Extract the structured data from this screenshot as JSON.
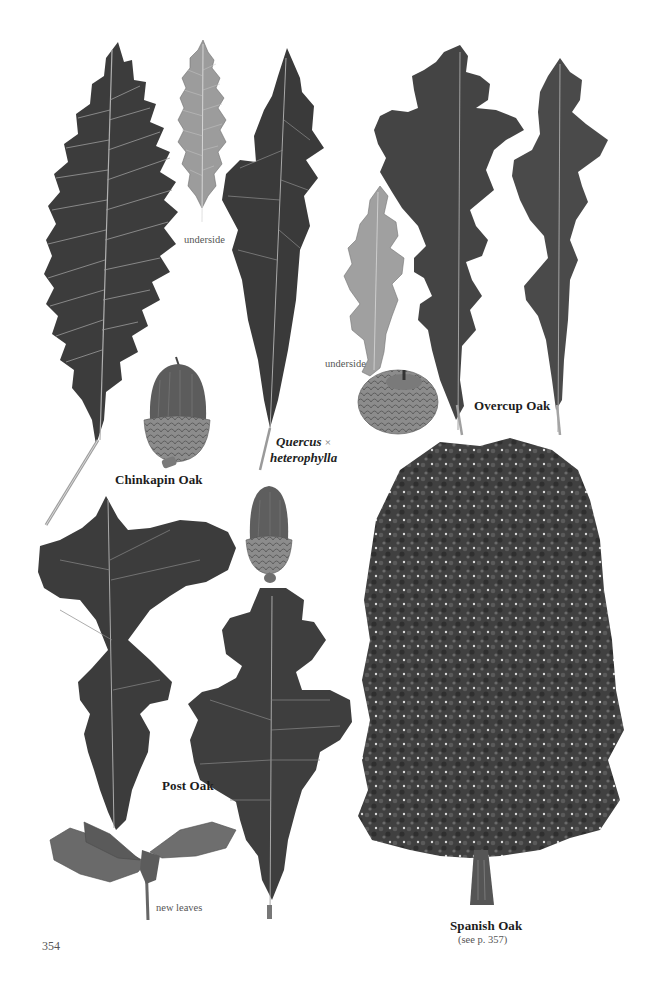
{
  "page": {
    "number": "354",
    "background": "#ffffff"
  },
  "species": [
    {
      "id": "chinkapin-oak",
      "label": "Chinkapin Oak",
      "items": [
        "leaf",
        "leaf-underside",
        "acorn"
      ],
      "underside_label": "underside"
    },
    {
      "id": "quercus-heterophylla",
      "label_genus": "Quercus",
      "label_hybrid_sign": "×",
      "label_epithet": "heterophylla",
      "items": [
        "leaf"
      ]
    },
    {
      "id": "overcup-oak",
      "label": "Overcup Oak",
      "items": [
        "leaf",
        "leaf",
        "leaf-underside",
        "acorn"
      ],
      "underside_label": "underside"
    },
    {
      "id": "post-oak",
      "label": "Post Oak",
      "items": [
        "leaf",
        "leaf",
        "acorn",
        "new-leaves-twig"
      ],
      "new_leaves_label": "new leaves"
    },
    {
      "id": "spanish-oak",
      "label": "Spanish Oak",
      "cross_reference": "(see p. 357)",
      "items": [
        "tree-silhouette"
      ]
    }
  ],
  "colors": {
    "leaf_dark": "#3a3a3a",
    "leaf_mid": "#4a4a4a",
    "leaf_underside": "#9a9a9a",
    "new_leaves": "#6a6a6a",
    "acorn_cap": "#8a8a8a",
    "acorn_nut": "#5a5a5a",
    "vein": "#b5b5b5",
    "tree": "#3f3f3f"
  }
}
